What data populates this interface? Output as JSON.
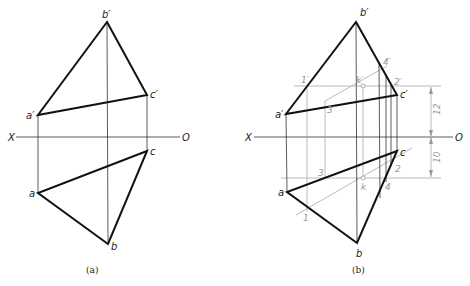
{
  "figure_a": {
    "caption": "(a)",
    "axis": {
      "left": "X",
      "right": "O"
    },
    "labels": {
      "b_prime": "b′",
      "c_prime": "c′",
      "a_prime": "a′",
      "a": "a",
      "b": "b",
      "c": "c"
    }
  },
  "figure_b": {
    "caption": "(b)",
    "axis": {
      "left": "X",
      "right": "O"
    },
    "labels": {
      "b_prime": "b′",
      "c_prime": "c′",
      "a_prime": "a′",
      "a": "a",
      "b": "b",
      "c": "c",
      "p1_prime": "1′",
      "p2_prime": "2′",
      "p3_prime": "3′",
      "p4_prime": "4′",
      "k_prime": "k′",
      "p1": "1",
      "p2": "2",
      "p3": "3",
      "p4": "4",
      "k": "k"
    },
    "dimensions": {
      "upper": "12",
      "lower": "10"
    }
  }
}
